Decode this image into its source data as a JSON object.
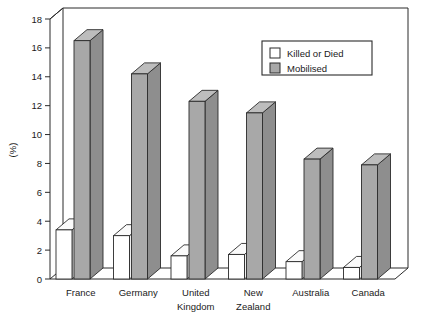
{
  "chart_data": {
    "type": "bar",
    "title": "",
    "subtitle": "",
    "xlabel": "",
    "ylabel": "(%)",
    "ylim": [
      0,
      18
    ],
    "yticks": [
      0,
      2,
      4,
      6,
      8,
      10,
      12,
      14,
      16,
      18
    ],
    "ytick_labels": [
      "0",
      "2",
      "4",
      "6",
      "8",
      "10",
      "12",
      "14",
      "16",
      "18"
    ],
    "grid": false,
    "three_d": true,
    "legend_position": "top-right",
    "categories": [
      "France",
      "Germany",
      "United Kingdom",
      "New Zealand",
      "Australia",
      "Canada"
    ],
    "category_label_lines": [
      [
        "France"
      ],
      [
        "Germany"
      ],
      [
        "United",
        "Kingdom"
      ],
      [
        "New",
        "Zealand"
      ],
      [
        "Australia"
      ],
      [
        "Canada"
      ]
    ],
    "series": [
      {
        "name": "Killed or Died",
        "color": "#ffffff",
        "values": [
          3.4,
          3.0,
          1.6,
          1.7,
          1.2,
          0.8
        ]
      },
      {
        "name": "Mobilised",
        "color": "#a8a8a8",
        "values": [
          16.5,
          14.2,
          12.3,
          11.5,
          8.3,
          7.9
        ]
      }
    ]
  },
  "legend": {
    "items": [
      {
        "label": "Killed or Died",
        "swatch": "white-swatch-icon"
      },
      {
        "label": "Mobilised",
        "swatch": "gray-swatch-icon"
      }
    ]
  },
  "colors": {
    "series_killed": "#ffffff",
    "series_mobilised": "#a8a8a8",
    "axis": "#2a2a2a",
    "background": "#ffffff"
  }
}
